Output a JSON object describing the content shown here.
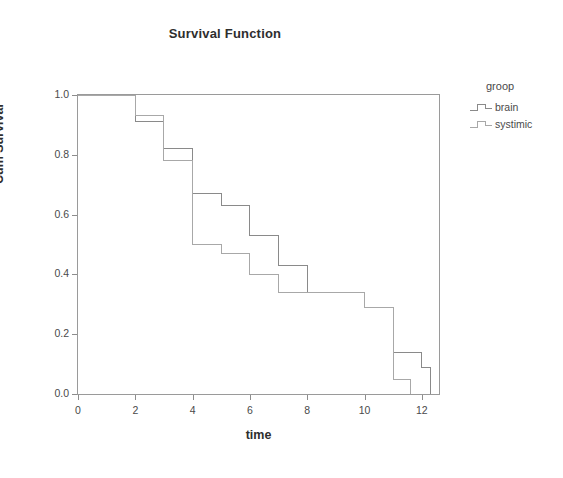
{
  "chart": {
    "title": "Survival Function",
    "xlabel": "time",
    "ylabel": "Cum Survival"
  },
  "legend": {
    "title": "groop",
    "items": [
      {
        "label": "brain",
        "color": "#8a8a8a"
      },
      {
        "label": "systimic",
        "color": "#a8a8a8"
      }
    ]
  },
  "axis": {
    "y_ticks": [
      "1.0",
      "0.8",
      "0.6",
      "0.4",
      "0.2",
      "0.0"
    ],
    "x_ticks": [
      "0",
      "2",
      "4",
      "6",
      "8",
      "10",
      "12"
    ]
  },
  "chart_data": {
    "type": "line",
    "subtype": "kaplan-meier-step",
    "title": "Survival Function",
    "xlabel": "time",
    "ylabel": "Cum Survival",
    "xlim": [
      0,
      12.6
    ],
    "ylim": [
      0.0,
      1.0
    ],
    "grid": false,
    "legend_position": "right",
    "legend_title": "groop",
    "x_ticks": [
      0,
      2,
      4,
      6,
      8,
      10,
      12
    ],
    "y_ticks": [
      0.0,
      0.2,
      0.4,
      0.6,
      0.8,
      1.0
    ],
    "series": [
      {
        "name": "brain",
        "color": "#8a8a8a",
        "steps": [
          {
            "time": 0.0,
            "survival": 1.0
          },
          {
            "time": 2.0,
            "survival": 1.0
          },
          {
            "time": 2.0,
            "survival": 0.91
          },
          {
            "time": 3.0,
            "survival": 0.91
          },
          {
            "time": 3.0,
            "survival": 0.82
          },
          {
            "time": 4.0,
            "survival": 0.82
          },
          {
            "time": 4.0,
            "survival": 0.67
          },
          {
            "time": 5.0,
            "survival": 0.67
          },
          {
            "time": 5.0,
            "survival": 0.63
          },
          {
            "time": 6.0,
            "survival": 0.63
          },
          {
            "time": 6.0,
            "survival": 0.53
          },
          {
            "time": 7.0,
            "survival": 0.53
          },
          {
            "time": 7.0,
            "survival": 0.43
          },
          {
            "time": 8.0,
            "survival": 0.43
          },
          {
            "time": 8.0,
            "survival": 0.34
          },
          {
            "time": 10.0,
            "survival": 0.34
          },
          {
            "time": 10.0,
            "survival": 0.29
          },
          {
            "time": 11.0,
            "survival": 0.29
          },
          {
            "time": 11.0,
            "survival": 0.14
          },
          {
            "time": 12.0,
            "survival": 0.14
          },
          {
            "time": 12.0,
            "survival": 0.09
          },
          {
            "time": 12.3,
            "survival": 0.09
          },
          {
            "time": 12.3,
            "survival": 0.0
          }
        ]
      },
      {
        "name": "systimic",
        "color": "#a8a8a8",
        "steps": [
          {
            "time": 0.0,
            "survival": 1.0
          },
          {
            "time": 2.0,
            "survival": 1.0
          },
          {
            "time": 2.0,
            "survival": 0.93
          },
          {
            "time": 3.0,
            "survival": 0.93
          },
          {
            "time": 3.0,
            "survival": 0.78
          },
          {
            "time": 4.0,
            "survival": 0.78
          },
          {
            "time": 4.0,
            "survival": 0.5
          },
          {
            "time": 5.0,
            "survival": 0.5
          },
          {
            "time": 5.0,
            "survival": 0.47
          },
          {
            "time": 6.0,
            "survival": 0.47
          },
          {
            "time": 6.0,
            "survival": 0.4
          },
          {
            "time": 7.0,
            "survival": 0.4
          },
          {
            "time": 7.0,
            "survival": 0.34
          },
          {
            "time": 10.0,
            "survival": 0.34
          },
          {
            "time": 10.0,
            "survival": 0.29
          },
          {
            "time": 11.0,
            "survival": 0.29
          },
          {
            "time": 11.0,
            "survival": 0.05
          },
          {
            "time": 11.6,
            "survival": 0.05
          },
          {
            "time": 11.6,
            "survival": 0.0
          }
        ]
      }
    ]
  }
}
